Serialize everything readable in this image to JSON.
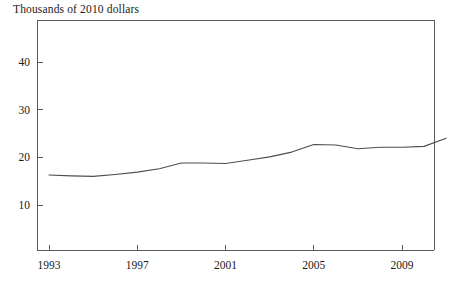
{
  "chart_data": {
    "type": "line",
    "title": "Thousands of 2010 dollars",
    "xlabel": "",
    "ylabel": "Thousands of 2010 dollars",
    "xlim": [
      1993,
      2011
    ],
    "ylim": [
      0,
      46
    ],
    "grid": false,
    "legend": null,
    "y_ticks": [
      10,
      20,
      30,
      40
    ],
    "y_tick_labels": [
      "10",
      "20",
      "30",
      "40"
    ],
    "x_ticks": [
      1993,
      1997,
      2001,
      2005,
      2009
    ],
    "x_tick_labels": [
      "1993",
      "1997",
      "2001",
      "2005",
      "2009"
    ],
    "series": [
      {
        "name": "Thousands of 2010 dollars",
        "color": "#4d4d4d",
        "x": [
          1993,
          1994,
          1995,
          1996,
          1997,
          1998,
          1999,
          2000,
          2001,
          2002,
          2003,
          2004,
          2005,
          2006,
          2007,
          2008,
          2009,
          2010,
          2011
        ],
        "values": [
          16.3,
          16.1,
          16.0,
          16.4,
          16.9,
          17.6,
          18.8,
          18.8,
          18.7,
          19.4,
          20.1,
          21.1,
          22.7,
          22.6,
          21.8,
          22.1,
          22.1,
          22.3,
          24.0
        ]
      }
    ]
  },
  "axes": {
    "frame": {
      "left_px": 37,
      "right_px": 434,
      "top_px": 20,
      "bottom_px": 250
    }
  }
}
